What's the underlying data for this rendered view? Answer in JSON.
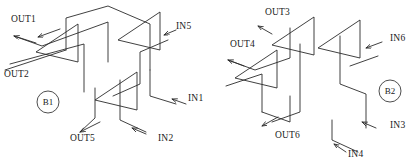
{
  "figure": {
    "type": "isometric-waveguide-coupler-schematic",
    "background_color": "#ffffff",
    "line_color": "#2b2b2b",
    "text_color": "#1a1a1a"
  },
  "blocks": [
    {
      "id": "B1",
      "badge_label": "B1",
      "badge": {
        "cx": 48,
        "cy": 102,
        "r": 11
      },
      "ports": [
        {
          "name": "OUT1",
          "label": "OUT1",
          "direction": "out",
          "x": 11,
          "y": 22
        },
        {
          "name": "OUT2",
          "label": "OUT2",
          "direction": "out",
          "x": 4,
          "y": 77
        },
        {
          "name": "OUT5",
          "label": "OUT5",
          "direction": "out",
          "x": 70,
          "y": 141
        },
        {
          "name": "IN5",
          "label": "IN5",
          "direction": "in",
          "x": 176,
          "y": 29
        },
        {
          "name": "IN1",
          "label": "IN1",
          "direction": "in",
          "x": 188,
          "y": 101
        },
        {
          "name": "IN2",
          "label": "IN2",
          "direction": "in",
          "x": 158,
          "y": 141
        }
      ]
    },
    {
      "id": "B2",
      "badge_label": "B2",
      "badge": {
        "cx": 390,
        "cy": 91,
        "r": 11
      },
      "ports": [
        {
          "name": "OUT3",
          "label": "OUT3",
          "direction": "out",
          "x": 265,
          "y": 15
        },
        {
          "name": "OUT4",
          "label": "OUT4",
          "direction": "out",
          "x": 230,
          "y": 47
        },
        {
          "name": "OUT6",
          "label": "OUT6",
          "direction": "out",
          "x": 275,
          "y": 138
        },
        {
          "name": "IN6",
          "label": "IN6",
          "direction": "in",
          "x": 390,
          "y": 41
        },
        {
          "name": "IN3",
          "label": "IN3",
          "direction": "in",
          "x": 390,
          "y": 128
        },
        {
          "name": "IN4",
          "label": "IN4",
          "direction": "in",
          "x": 348,
          "y": 157
        }
      ]
    }
  ],
  "geometry": {
    "left": {
      "prisms": [
        "M 36,52 L 78,24 L 78,62 Z",
        "M 95,100 L 137,72 L 137,110 Z",
        "M 118,40 L 160,12 L 160,50 Z"
      ],
      "paths": [
        "M 14,36 L 42,46 L 108,22 L 108,62",
        "M 10,64 L 84,44 L 84,92",
        "M 5,70 L 66,50",
        "M 66,50 L 66,18 L 108,6 L 150,24 L 150,70",
        "M 150,70 L 150,96 L 176,104",
        "M 168,40 L 140,52 L 140,84 L 113,96",
        "M 95,88 L 95,118 L 80,132",
        "M 120,80 L 120,120 L 146,132",
        "M 137,72 L 137,110",
        "M 78,24 L 78,62",
        "M 160,12 L 160,50"
      ],
      "arrows": [
        {
          "x1": 60,
          "y1": 29,
          "x2": 38,
          "y2": 37
        },
        {
          "x1": 36,
          "y1": 43,
          "x2": 14,
          "y2": 36
        },
        {
          "x1": 100,
          "y1": 122,
          "x2": 80,
          "y2": 132
        },
        {
          "x1": 164,
          "y1": 35,
          "x2": 176,
          "y2": 30
        },
        {
          "x1": 172,
          "y1": 99,
          "x2": 186,
          "y2": 104
        },
        {
          "x1": 132,
          "y1": 128,
          "x2": 146,
          "y2": 134
        }
      ]
    },
    "right": {
      "prisms": [
        "M 235,78 L 277,50 L 277,88 Z",
        "M 272,45 L 314,17 L 314,55 Z",
        "M 318,48 L 360,20 L 360,58 Z"
      ],
      "paths": [
        "M 228,60 L 255,70 L 290,58 L 290,28",
        "M 226,86 L 262,74 L 262,112",
        "M 262,112 L 290,122 L 290,96",
        "M 300,44 L 300,112 L 272,122",
        "M 340,36 L 340,84 L 366,94 L 366,128",
        "M 378,56 L 350,66",
        "M 332,120 L 332,140 L 358,152",
        "M 314,17 L 314,55",
        "M 277,50 L 277,88",
        "M 360,20 L 360,58"
      ],
      "arrows": [
        {
          "x1": 272,
          "y1": 34,
          "x2": 258,
          "y2": 26
        },
        {
          "x1": 244,
          "y1": 66,
          "x2": 228,
          "y2": 60
        },
        {
          "x1": 278,
          "y1": 117,
          "x2": 262,
          "y2": 126
        },
        {
          "x1": 366,
          "y1": 48,
          "x2": 382,
          "y2": 42
        },
        {
          "x1": 362,
          "y1": 122,
          "x2": 376,
          "y2": 128
        },
        {
          "x1": 334,
          "y1": 144,
          "x2": 346,
          "y2": 152
        }
      ]
    }
  }
}
